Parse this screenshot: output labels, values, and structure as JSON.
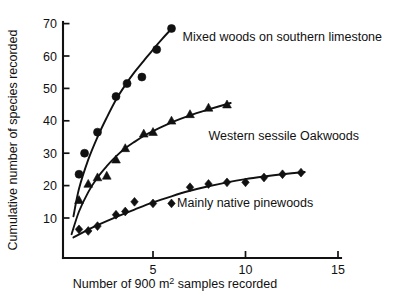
{
  "chart_data": {
    "type": "scatter",
    "title": "",
    "xlabel": "Number of 900 m² samples recorded",
    "ylabel": "Cumulative number of species recorded",
    "xlim": [
      0,
      15
    ],
    "ylim": [
      0,
      75
    ],
    "grid": false,
    "legend_position": "inline-annotations",
    "xticks": [
      5,
      10,
      15
    ],
    "xtick_labels": [
      "5",
      "10",
      "15"
    ],
    "yticks": [
      10,
      20,
      30,
      40,
      50,
      60,
      70
    ],
    "ytick_labels": [
      "10",
      "20",
      "30",
      "40",
      "50",
      "60",
      "70"
    ],
    "series": [
      {
        "name": "Mixed woods on southern limestone",
        "marker": "circle",
        "annotation": "Mixed woods on southern limestone",
        "annotation_x": 6.6,
        "annotation_y": 64.5,
        "points": [
          [
            1.0,
            23.5
          ],
          [
            1.3,
            30.0
          ],
          [
            2.0,
            36.5
          ],
          [
            3.0,
            47.5
          ],
          [
            3.6,
            51.5
          ],
          [
            4.4,
            53.5
          ],
          [
            5.2,
            62.0
          ],
          [
            6.0,
            68.5
          ]
        ],
        "fit_curve": [
          [
            0.7,
            10.5
          ],
          [
            1.0,
            19.0
          ],
          [
            1.5,
            28.0
          ],
          [
            2.0,
            35.0
          ],
          [
            2.5,
            41.0
          ],
          [
            3.0,
            46.5
          ],
          [
            3.5,
            51.0
          ],
          [
            4.0,
            55.0
          ],
          [
            4.5,
            58.5
          ],
          [
            5.0,
            62.0
          ],
          [
            5.5,
            65.3
          ],
          [
            6.1,
            69.0
          ]
        ]
      },
      {
        "name": "Western sessile Oakwoods",
        "marker": "triangle",
        "annotation": "Western sessile Oakwoods",
        "annotation_x": 8.0,
        "annotation_y": 34.0,
        "points": [
          [
            1.0,
            15.5
          ],
          [
            1.5,
            20.5
          ],
          [
            2.0,
            22.5
          ],
          [
            2.5,
            23.0
          ],
          [
            3.0,
            28.0
          ],
          [
            3.5,
            31.5
          ],
          [
            4.5,
            36.0
          ],
          [
            5.0,
            36.5
          ],
          [
            6.0,
            40.0
          ],
          [
            7.0,
            42.0
          ],
          [
            8.0,
            44.0
          ],
          [
            9.0,
            45.0
          ]
        ],
        "fit_curve": [
          [
            0.6,
            5.0
          ],
          [
            1.0,
            12.0
          ],
          [
            1.5,
            18.0
          ],
          [
            2.0,
            22.5
          ],
          [
            2.5,
            26.0
          ],
          [
            3.0,
            29.0
          ],
          [
            3.5,
            31.5
          ],
          [
            4.0,
            33.5
          ],
          [
            4.5,
            35.3
          ],
          [
            5.0,
            36.8
          ],
          [
            6.0,
            39.5
          ],
          [
            7.0,
            41.7
          ],
          [
            8.0,
            43.5
          ],
          [
            9.2,
            45.5
          ]
        ]
      },
      {
        "name": "Mainly native pinewoods",
        "marker": "diamond",
        "annotation": "Mainly native pinewoods",
        "annotation_x": 6.3,
        "annotation_y": 13.5,
        "points": [
          [
            1.0,
            6.5
          ],
          [
            1.5,
            6.0
          ],
          [
            2.0,
            7.5
          ],
          [
            3.0,
            11.0
          ],
          [
            3.5,
            12.0
          ],
          [
            4.0,
            15.0
          ],
          [
            5.0,
            14.5
          ],
          [
            6.0,
            14.5
          ],
          [
            7.0,
            19.5
          ],
          [
            8.0,
            20.5
          ],
          [
            9.0,
            21.0
          ],
          [
            10.0,
            21.0
          ],
          [
            11.0,
            22.5
          ],
          [
            12.0,
            23.5
          ],
          [
            13.0,
            24.0
          ]
        ],
        "fit_curve": [
          [
            0.7,
            4.0
          ],
          [
            1.5,
            6.4
          ],
          [
            2.0,
            7.8
          ],
          [
            3.0,
            10.3
          ],
          [
            4.0,
            12.6
          ],
          [
            5.0,
            14.8
          ],
          [
            6.0,
            16.7
          ],
          [
            7.0,
            18.4
          ],
          [
            8.0,
            19.8
          ],
          [
            9.0,
            21.0
          ],
          [
            10.0,
            22.0
          ],
          [
            11.0,
            22.8
          ],
          [
            12.0,
            23.5
          ],
          [
            13.2,
            24.2
          ]
        ]
      }
    ]
  }
}
